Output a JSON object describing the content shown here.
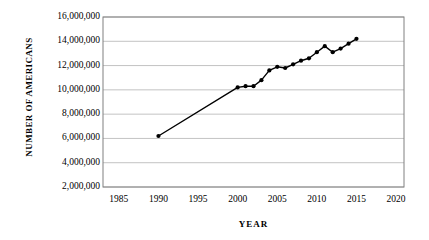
{
  "chart_data": {
    "type": "line",
    "title": "",
    "subtitle": "",
    "xlabel": "YEAR",
    "ylabel": "NUMBER OF AMERICANS",
    "xlim": [
      1983,
      2021
    ],
    "ylim": [
      2000000,
      16000000
    ],
    "grid": true,
    "legend": "none",
    "x_ticks": [
      1985,
      1990,
      1995,
      2000,
      2005,
      2010,
      2015,
      2020
    ],
    "x_tick_labels": [
      "1985",
      "1990",
      "1995",
      "2000",
      "2005",
      "2010",
      "2015",
      "2020"
    ],
    "y_ticks": [
      2000000,
      4000000,
      6000000,
      8000000,
      10000000,
      12000000,
      14000000,
      16000000
    ],
    "y_tick_labels": [
      "2,000,000",
      "4,000,000",
      "6,000,000",
      "8,000,000",
      "10,000,000",
      "12,000,000",
      "14,000,000",
      "16,000,000"
    ],
    "marker": "filled-circle",
    "line_color": "#000000",
    "marker_color": "#000000",
    "series": [
      {
        "name": "Number of Americans",
        "x": [
          1990,
          2000,
          2001,
          2002,
          2003,
          2004,
          2005,
          2006,
          2007,
          2008,
          2009,
          2010,
          2011,
          2012,
          2013,
          2014,
          2015
        ],
        "values": [
          6200000,
          10200000,
          10300000,
          10300000,
          10800000,
          11600000,
          11900000,
          11800000,
          12100000,
          12400000,
          12600000,
          13100000,
          13600000,
          13100000,
          13400000,
          13800000,
          14200000
        ]
      }
    ]
  },
  "axes": {
    "y_title": "NUMBER OF AMERICANS",
    "x_title": "YEAR"
  },
  "colors": {
    "line": "#000000",
    "grid": "#b3b3b3",
    "frame": "#808080",
    "background": "#ffffff",
    "text": "#000000"
  }
}
